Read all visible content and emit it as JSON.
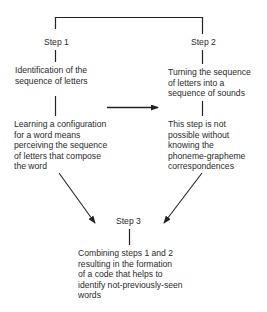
{
  "diagram": {
    "step1": {
      "label": "Step 1",
      "box1": [
        "Identification of the",
        "sequence of letters"
      ],
      "box2": [
        "Learning a configuration",
        "for a word means",
        "perceiving the sequence",
        "of letters that compose",
        "the word"
      ]
    },
    "step2": {
      "label": "Step 2",
      "box1": [
        "Turning the sequence",
        "of letters into a",
        "sequence of sounds"
      ],
      "box2": [
        "This step is not",
        "possible without",
        "knowing the",
        "phoneme-grapheme",
        "correspondences"
      ]
    },
    "step3": {
      "label": "Step 3",
      "box1": [
        "Combining steps 1 and 2",
        "resulting in the formation",
        "of a code that helps to",
        "identify not-previously-seen",
        "words"
      ]
    },
    "connectors": {
      "top_bracket": "Step 1 to Step 2",
      "horizontal_arrow": "Step 1 column to Step 2 column",
      "diagonal_arrows": [
        "Step 1 to Step 3",
        "Step 2 to Step 3"
      ]
    },
    "colors": {
      "line": "#222222",
      "text": "#2a2a2a",
      "background": "#ffffff"
    }
  }
}
